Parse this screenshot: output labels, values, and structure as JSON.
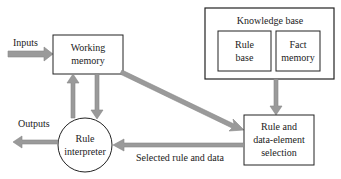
{
  "colors": {
    "box_stroke": "#222222",
    "arrow_fill": "#9a9a9a",
    "arrow_stroke": "#888888",
    "text": "#222222",
    "background": "#ffffff"
  },
  "nodes": {
    "working_memory": {
      "line1": "Working",
      "line2": "memory"
    },
    "knowledge_base": {
      "title": "Knowledge base"
    },
    "rule_base": {
      "line1": "Rule",
      "line2": "base"
    },
    "fact_memory": {
      "line1": "Fact",
      "line2": "memory"
    },
    "rule_interpreter": {
      "line1": "Rule",
      "line2": "interpreter"
    },
    "selection": {
      "line1": "Rule and",
      "line2": "data-element",
      "line3": "selection"
    }
  },
  "labels": {
    "inputs": "Inputs",
    "outputs": "Outputs",
    "selected": "Selected rule and data"
  }
}
